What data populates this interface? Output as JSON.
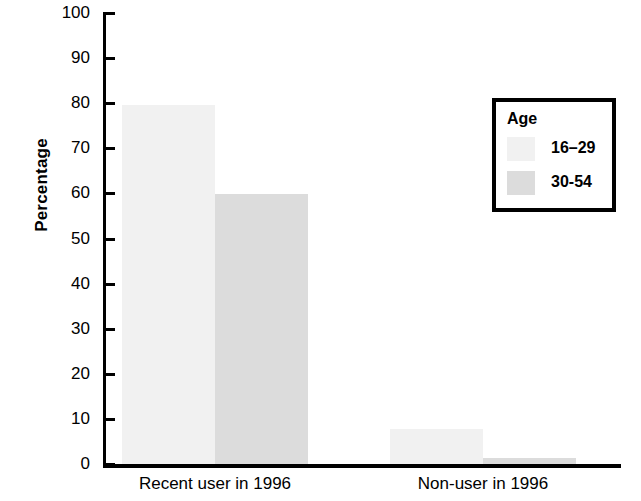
{
  "chart_data": {
    "type": "bar",
    "title": "",
    "xlabel": "",
    "ylabel": "Percentage",
    "ylim": [
      0,
      100
    ],
    "ytick_step": 10,
    "grid": false,
    "legend_position": "top-right",
    "categories": [
      "Recent user in 1996",
      "Non-user in 1996"
    ],
    "series": [
      {
        "name": "16–29",
        "color": "#f1f1f1",
        "values": [
          79.5,
          7.7
        ]
      },
      {
        "name": "30-54",
        "color": "#dcdcdc",
        "values": [
          59.8,
          1.4
        ]
      }
    ],
    "yticks": [
      {
        "value": 100,
        "label": "100"
      },
      {
        "value": 90,
        "label": "90"
      },
      {
        "value": 80,
        "label": "80"
      },
      {
        "value": 70,
        "label": "70"
      },
      {
        "value": 60,
        "label": "60"
      },
      {
        "value": 50,
        "label": "50"
      },
      {
        "value": 40,
        "label": "40"
      },
      {
        "value": 30,
        "label": "30"
      },
      {
        "value": 20,
        "label": "20"
      },
      {
        "value": 10,
        "label": "10"
      },
      {
        "value": 0,
        "label": "0"
      }
    ]
  },
  "legend": {
    "title": "Age",
    "entries": [
      {
        "label": "16–29",
        "color": "#f1f1f1"
      },
      {
        "label": "30-54",
        "color": "#dcdcdc"
      }
    ]
  },
  "axes": {
    "y_title": "Percentage"
  },
  "colors": {
    "axis": "#000000",
    "background": "#ffffff",
    "series_16_29": "#f1f1f1",
    "series_30_54": "#dcdcdc"
  }
}
